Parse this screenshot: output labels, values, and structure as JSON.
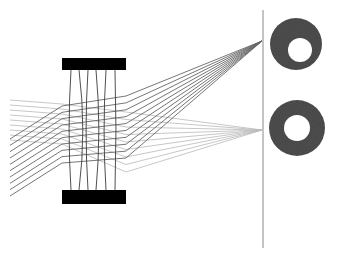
{
  "figure": {
    "kind": "optical-layout-diagram",
    "width": 338,
    "height": 258,
    "background_color": "#ffffff"
  },
  "chart_data": {
    "type": "scatter",
    "xlabel": "",
    "ylabel": "",
    "xlim": [
      0,
      338
    ],
    "ylim": [
      0,
      258
    ],
    "grid": false,
    "legend_position": "none"
  },
  "colors": {
    "background": "#ffffff",
    "lens_barrel": "#000000",
    "lens_element_line": "#3c3c3c",
    "ray_upper_bundle": "#b9b9b9",
    "ray_lower_bundle": "#666666",
    "image_plane_line": "#8a8a8a",
    "spot_fill": "#4e4e4e",
    "spot_hole": "#ffffff"
  },
  "lens": {
    "label": "lens-assembly",
    "left_x": 62,
    "right_x": 126,
    "top_bar": {
      "x": 62,
      "y": 58,
      "width": 64,
      "height": 12
    },
    "bottom_bar": {
      "x": 62,
      "y": 190,
      "width": 64,
      "height": 14
    },
    "element_count": 6,
    "element_lines": [
      {
        "top_x": 71,
        "mid_x": 69,
        "bottom_x": 71
      },
      {
        "top_x": 79,
        "mid_x": 83,
        "bottom_x": 79
      },
      {
        "top_x": 88,
        "mid_x": 86,
        "bottom_x": 88
      },
      {
        "top_x": 96,
        "mid_x": 99,
        "bottom_x": 96
      },
      {
        "top_x": 106,
        "mid_x": 104,
        "bottom_x": 106
      },
      {
        "top_x": 115,
        "mid_x": 116,
        "bottom_x": 115
      }
    ],
    "element_top_y": 70,
    "element_bottom_y": 190
  },
  "image_plane": {
    "label": "image-plane",
    "x": 263,
    "y_top": 10,
    "y_bottom": 248
  },
  "ray_bundles": [
    {
      "name": "upper-field-bundle",
      "shade": "#b9b9b9",
      "stroke_width": 0.8,
      "ray_count": 9,
      "entry_x": 10,
      "entry_y_first": 100,
      "entry_y_last": 140,
      "lens_in_y_first": 104,
      "lens_in_y_last": 144,
      "lens_out_y_first": 112,
      "lens_out_y_last": 172,
      "focus_x": 262,
      "focus_y": 130
    },
    {
      "name": "lower-field-bundle",
      "shade": "#666666",
      "stroke_width": 0.9,
      "ray_count": 10,
      "entry_x": 10,
      "entry_y_first": 139,
      "entry_y_last": 196,
      "lens_in_y_first": 106,
      "lens_in_y_last": 163,
      "lens_out_y_first": 96,
      "lens_out_y_last": 158,
      "focus_x": 262,
      "focus_y": 41
    }
  ],
  "spot_diagrams": [
    {
      "name": "upper-spot-diagram",
      "cx": 296,
      "cy": 44,
      "outer_radius": 26,
      "hole_cx": 300,
      "hole_cy": 50,
      "hole_radius": 12,
      "fill": "#4e4e4e"
    },
    {
      "name": "lower-spot-diagram",
      "cx": 297,
      "cy": 128,
      "outer_radius": 28,
      "hole_cx": 297,
      "hole_cy": 128,
      "hole_radius": 13,
      "fill": "#4e4e4e"
    }
  ]
}
